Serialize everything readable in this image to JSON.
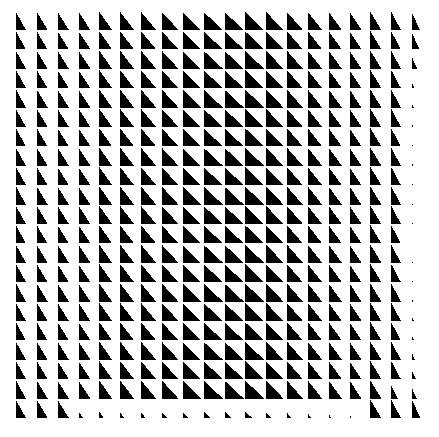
{
  "artwork": {
    "title": "Op-Art Right-Triangle Grid",
    "type": "generative-pattern",
    "width": 439,
    "height": 437,
    "background_color": "#ffffff",
    "ink_color": "#000000",
    "description": "Dense grid of black right triangles whose widths swell toward the horizontal centre, with the final column and final row degrading into progressively smaller shards except at the corners."
  },
  "grid": {
    "columns": 20,
    "rows": 21,
    "margin_left": 16,
    "margin_top": 12,
    "margin_right": 6,
    "margin_bottom": 6,
    "cell_width": 20.85,
    "cell_height": 19.4,
    "gap_x": 1.6,
    "gap_y": 1.4
  },
  "triangle": {
    "orientation": "right-angle-bottom-left",
    "vertices_note": "apex at top-left, then down the left edge to bottom-left, then right along the base; hypotenuse runs top-left to bottom-right",
    "fill": "#000000",
    "stroke": "none"
  },
  "width_profile": {
    "label": "relative triangle base width per column (0-1 of cell width)",
    "values": [
      0.52,
      0.56,
      0.58,
      0.62,
      0.66,
      0.72,
      0.78,
      0.86,
      0.93,
      1.0,
      1.0,
      0.97,
      0.9,
      0.82,
      0.74,
      0.68,
      0.62,
      0.57,
      0.5,
      0.42
    ]
  },
  "height_profile": {
    "label": "relative triangle height per row (0-1 of cell height)",
    "values": [
      1.0,
      1.0,
      1.0,
      1.0,
      1.0,
      1.0,
      1.0,
      1.0,
      1.0,
      1.0,
      1.0,
      1.0,
      1.0,
      1.0,
      1.0,
      1.0,
      1.0,
      1.0,
      1.0,
      1.0,
      1.0
    ]
  },
  "last_column": {
    "label": "column 20 - degradation scale factors, top row to bottom row",
    "scales": [
      0.95,
      0.9,
      0.62,
      0.3,
      0.2,
      0.16,
      0.14,
      0.12,
      0.1,
      0.09,
      0.08,
      0.09,
      0.1,
      0.12,
      0.16,
      0.2,
      0.26,
      0.34,
      0.46,
      0.95,
      1.0
    ]
  },
  "last_row": {
    "label": "row 21 - degradation scale factors, left column to right column",
    "scales": [
      1.0,
      1.0,
      1.0,
      0.38,
      0.34,
      0.3,
      0.3,
      0.32,
      0.34,
      0.36,
      0.38,
      0.36,
      0.32,
      0.28,
      0.24,
      0.2,
      0.16,
      1.0,
      1.0,
      1.0
    ]
  },
  "penultimate_row": {
    "label": "row 20 - partial degradation scale factors, left column to right column",
    "scales": [
      1.0,
      1.0,
      1.0,
      1.0,
      1.0,
      1.0,
      1.0,
      1.0,
      1.0,
      1.0,
      1.0,
      1.0,
      1.0,
      1.0,
      1.0,
      1.0,
      1.0,
      1.0,
      0.7,
      0.55
    ]
  },
  "meta": {
    "palette": [
      "#000000",
      "#ffffff"
    ],
    "triangle_count_nominal": 420
  }
}
